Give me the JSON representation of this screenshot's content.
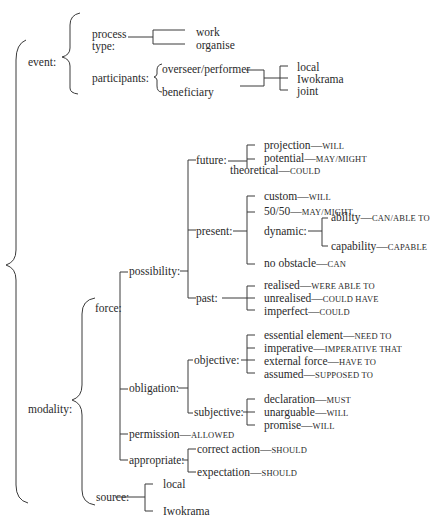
{
  "diagram": {
    "type": "system-network",
    "root": {
      "event": {
        "label": "event:",
        "process_type": {
          "label_line1": "process",
          "label_line2": "type:",
          "options": [
            "work",
            "organise"
          ]
        },
        "participants": {
          "label": "participants:",
          "roles": [
            "overseer/performer",
            "beneficiary"
          ],
          "options": [
            "local",
            "Iwokrama",
            "joint"
          ]
        }
      },
      "modality": {
        "label": "modality:",
        "force": {
          "label": "force:",
          "possibility": {
            "label": "possibility:",
            "future": {
              "label": "future:",
              "items": [
                {
                  "term": "projection",
                  "marker": "WILL"
                },
                {
                  "term": "potential",
                  "marker": "MAY/MIGHT"
                },
                {
                  "term": "theoretical",
                  "marker": "COULD"
                }
              ]
            },
            "present": {
              "label": "present:",
              "items": [
                {
                  "term": "custom",
                  "marker": "WILL"
                },
                {
                  "term": "50/50",
                  "marker": "MAY/MIGHT"
                },
                {
                  "term": "no obstacle",
                  "marker": "CAN"
                }
              ],
              "dynamic": {
                "label": "dynamic:",
                "items": [
                  {
                    "term": "ability",
                    "marker": "CAN/ABLE TO"
                  },
                  {
                    "term": "capability",
                    "marker": "CAPABLE"
                  }
                ]
              }
            },
            "past": {
              "label": "past:",
              "items": [
                {
                  "term": "realised",
                  "marker": "WERE ABLE TO"
                },
                {
                  "term": "unrealised",
                  "marker": "COULD HAVE"
                },
                {
                  "term": "imperfect",
                  "marker": "COULD"
                }
              ]
            }
          },
          "obligation": {
            "label": "obligation:",
            "objective": {
              "label": "objective:",
              "items": [
                {
                  "term": "essential element",
                  "marker": "NEED TO"
                },
                {
                  "term": "imperative",
                  "marker": "IMPERATIVE THAT"
                },
                {
                  "term": "external force",
                  "marker": "HAVE TO"
                },
                {
                  "term": "assumed",
                  "marker": "SUPPOSED TO"
                }
              ]
            },
            "subjective": {
              "label": "subjective:",
              "items": [
                {
                  "term": "declaration",
                  "marker": "MUST"
                },
                {
                  "term": "unarguable",
                  "marker": "WILL"
                },
                {
                  "term": "promise",
                  "marker": "WILL"
                }
              ]
            }
          },
          "permission": {
            "term": "permission",
            "marker": "ALLOWED"
          },
          "appropriate": {
            "label": "appropriate:",
            "items": [
              {
                "term": "correct action",
                "marker": "SHOULD"
              },
              {
                "term": "expectation",
                "marker": "SHOULD"
              }
            ]
          }
        },
        "source": {
          "label": "source:",
          "options": [
            "local",
            "Iwokrama"
          ]
        }
      }
    },
    "dash": "—"
  }
}
